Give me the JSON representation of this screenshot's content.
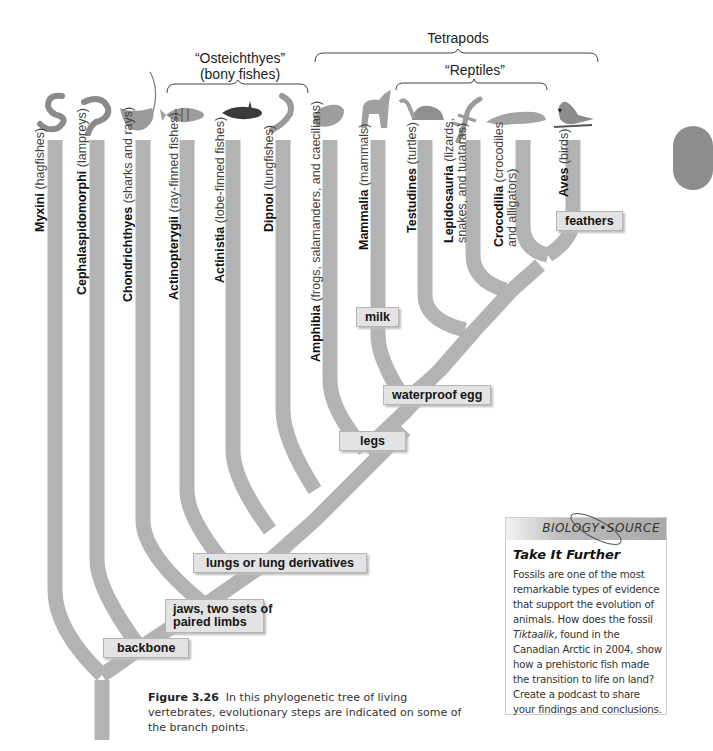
{
  "figure": {
    "caption_label": "Figure 3.26",
    "caption_text": "In this phylogenetic tree of living vertebrates, evolutionary steps are indicated on some of the branch points."
  },
  "groups": {
    "osteichthyes_title": "“Osteichthyes”",
    "osteichthyes_sub": "(bony fishes)",
    "tetrapods": "Tetrapods",
    "reptiles": "“Reptiles”"
  },
  "taxa": [
    {
      "name": "Myxini",
      "common": "(hagfishes)",
      "icon": "hagfish-icon"
    },
    {
      "name": "Cephalaspidomorphi",
      "common": "(lampreys)",
      "icon": "lamprey-icon"
    },
    {
      "name": "Chondrichthyes",
      "common": "(sharks and rays)",
      "icon": "ray-icon"
    },
    {
      "name": "Actinopterygii",
      "common": "(ray-finned fishes)",
      "icon": "perch-icon"
    },
    {
      "name": "Actinistia",
      "common": "(lobe-finned fishes)",
      "icon": "coelacanth-icon"
    },
    {
      "name": "Dipnoi",
      "common": "(lungfishes)",
      "icon": "lungfish-icon"
    },
    {
      "name": "Amphibia",
      "common": "(frogs, salamanders, and caecilians)",
      "icon": "frog-icon"
    },
    {
      "name": "Mammalia",
      "common": "(mammals)",
      "icon": "wolf-icon"
    },
    {
      "name": "Testudines",
      "common": "(turtles)",
      "icon": "turtle-icon"
    },
    {
      "name": "Lepidosauria",
      "common": "(lizards,",
      "common2": "snakes, and tuataras)",
      "icon": "lizard-icon"
    },
    {
      "name": "Crocodilia",
      "common": "(crocodiles",
      "common2": "and alligators)",
      "icon": "crocodile-icon"
    },
    {
      "name": "Aves",
      "common": "(birds)",
      "icon": "cardinal-icon"
    }
  ],
  "traits": {
    "backbone": "backbone",
    "jaws_line1": "jaws, two sets of",
    "jaws_line2": "paired limbs",
    "lungs": "lungs or lung derivatives",
    "legs": "legs",
    "waterproof_egg": "waterproof egg",
    "milk": "milk",
    "feathers": "feathers"
  },
  "sidebar": {
    "header": "BIOLOGY•SOURCE",
    "title": "Take It Further",
    "body_1": "Fossils are one of the most remarkable types of evidence that support the evolution of animals. How does the fossil ",
    "body_italic": "Tiktaalik",
    "body_2": ", found in the Canadian Arctic in 2004, show how a prehistoric fish made the transition to life on land? Create a podcast to share your findings and conclusions."
  },
  "colors": {
    "branch": "#b3b3b3",
    "trait_fill": "#e3e3e3",
    "header_gray": "#a9a9a9"
  }
}
